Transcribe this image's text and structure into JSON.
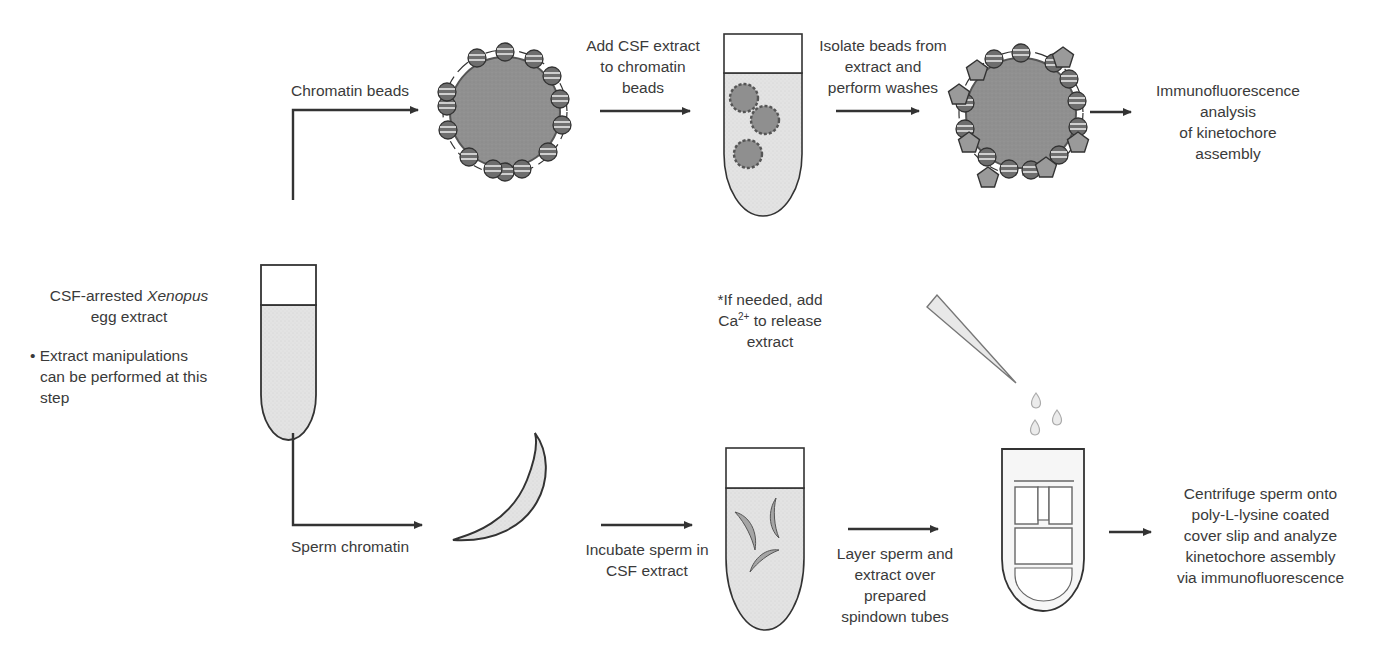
{
  "diagram": {
    "type": "workflow",
    "colors": {
      "stroke": "#333333",
      "bead_fill": "#8f8f8f",
      "extract_fill": "#e4e4e4",
      "nucleosome_fill": "#6e6e6e",
      "kinetochore_fill": "#9a9a9a",
      "background": "#ffffff"
    },
    "start": {
      "title_prefix": "CSF-arrested ",
      "title_italic": "Xenopus",
      "title_line2": "egg extract",
      "bullet": "•",
      "note_line1": "Extract manipulations",
      "note_line2": "can be performed at this",
      "note_line3": "step"
    },
    "top_branch": {
      "branch_label": "Chromatin beads",
      "step1": [
        "Add CSF extract",
        "to chromatin",
        "beads"
      ],
      "step2": [
        "Isolate beads from",
        "extract and",
        "perform washes"
      ],
      "result": [
        "Immunofluorescence",
        "analysis",
        "of kinetochore",
        "assembly"
      ]
    },
    "bottom_branch": {
      "branch_label": "Sperm chromatin",
      "step1": [
        "Incubate sperm in",
        "CSF extract"
      ],
      "step2": [
        "Layer sperm and",
        "extract over",
        "prepared",
        "spindown tubes"
      ],
      "calcium_note": {
        "line1": "*If needed, add",
        "line2_prefix": "Ca",
        "line2_sup": "2+",
        "line2_suffix": " to release",
        "line3": "extract"
      },
      "result": [
        "Centrifuge sperm onto",
        "poly-L-lysine coated",
        "cover slip and analyze",
        "kinetochore assembly",
        "via immunofluorescence"
      ]
    }
  }
}
